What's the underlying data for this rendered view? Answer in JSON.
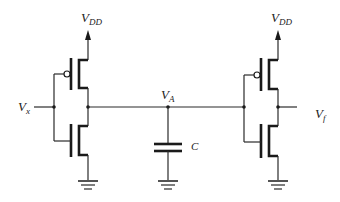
{
  "diagram": {
    "type": "circuit",
    "labels": {
      "vdd_left": {
        "main": "V",
        "sub": "DD"
      },
      "vdd_right": {
        "main": "V",
        "sub": "DD"
      },
      "input": {
        "main": "V",
        "sub": "x"
      },
      "node": {
        "main": "V",
        "sub": "A"
      },
      "output": {
        "main": "V",
        "sub": "f"
      },
      "capacitor": "C"
    },
    "components": [
      {
        "id": "pmos-left",
        "type": "PMOS"
      },
      {
        "id": "nmos-left",
        "type": "NMOS"
      },
      {
        "id": "capacitor",
        "type": "capacitor",
        "label": "C"
      },
      {
        "id": "pmos-right",
        "type": "PMOS"
      },
      {
        "id": "nmos-right",
        "type": "NMOS"
      }
    ],
    "colors": {
      "stroke": "#2a2a2a",
      "background": "#ffffff"
    }
  }
}
